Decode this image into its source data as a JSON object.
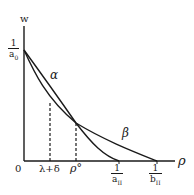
{
  "axes": {
    "y_label": "w",
    "x_label": "ρ",
    "origin_label": "0"
  },
  "y_intercept": {
    "numerator": "1",
    "denominator": "a",
    "subscript": "0"
  },
  "x_ticks": [
    {
      "label": "λ+δ"
    },
    {
      "label": "ρ°"
    },
    {
      "numerator": "1",
      "denominator": "a",
      "subscript": "II"
    },
    {
      "numerator": "1",
      "denominator": "b",
      "subscript": "II"
    }
  ],
  "curves": [
    {
      "name": "α",
      "endpoint": "1/a_II"
    },
    {
      "name": "β",
      "endpoint": "1/b_II"
    }
  ],
  "colors": {
    "ink": "#1a1a1a",
    "background": "#ffffff"
  }
}
